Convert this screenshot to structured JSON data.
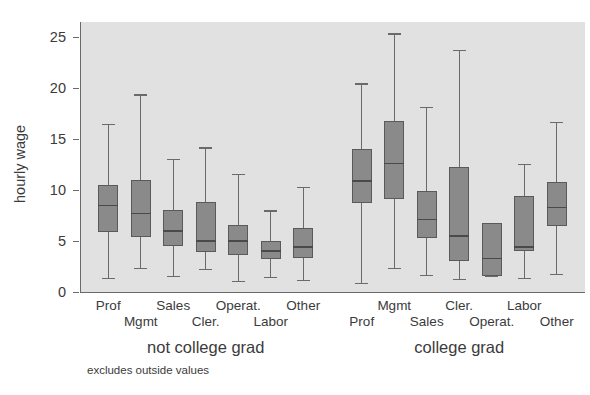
{
  "chart_data": {
    "type": "box",
    "title": "",
    "xlabel": "",
    "ylabel": "hourly wage",
    "ylim": [
      0,
      26.5
    ],
    "yticks": [
      0,
      5,
      10,
      15,
      20,
      25
    ],
    "ytick_labels": [
      "0",
      "5",
      "10",
      "15",
      "20",
      "25"
    ],
    "grid": false,
    "legend": "none",
    "note": "excludes outside values",
    "groups": [
      {
        "name": "not college grad",
        "categories": [
          "Prof",
          "Mgmt",
          "Sales",
          "Cler.",
          "Operat.",
          "Labor",
          "Other"
        ],
        "boxes": [
          {
            "label": "Prof",
            "whisker_low": 1.4,
            "q1": 5.9,
            "median": 8.5,
            "q3": 10.5,
            "whisker_high": 16.5
          },
          {
            "label": "Mgmt",
            "whisker_low": 2.4,
            "q1": 5.4,
            "median": 7.7,
            "q3": 11.0,
            "whisker_high": 19.4
          },
          {
            "label": "Sales",
            "whisker_low": 1.6,
            "q1": 4.5,
            "median": 6.0,
            "q3": 8.0,
            "whisker_high": 13.1
          },
          {
            "label": "Cler.",
            "whisker_low": 2.3,
            "q1": 3.9,
            "median": 5.0,
            "q3": 8.8,
            "whisker_high": 14.2
          },
          {
            "label": "Operat.",
            "whisker_low": 1.1,
            "q1": 3.6,
            "median": 5.0,
            "q3": 6.6,
            "whisker_high": 11.6
          },
          {
            "label": "Labor",
            "whisker_low": 1.5,
            "q1": 3.2,
            "median": 4.0,
            "q3": 5.0,
            "whisker_high": 8.0
          },
          {
            "label": "Other",
            "whisker_low": 1.2,
            "q1": 3.3,
            "median": 4.4,
            "q3": 6.3,
            "whisker_high": 10.3
          }
        ]
      },
      {
        "name": "college grad",
        "categories": [
          "Prof",
          "Mgmt",
          "Sales",
          "Cler.",
          "Operat.",
          "Labor",
          "Other"
        ],
        "boxes": [
          {
            "label": "Prof",
            "whisker_low": 0.9,
            "q1": 8.7,
            "median": 10.9,
            "q3": 14.0,
            "whisker_high": 20.5
          },
          {
            "label": "Mgmt",
            "whisker_low": 2.4,
            "q1": 9.1,
            "median": 12.6,
            "q3": 16.8,
            "whisker_high": 25.4
          },
          {
            "label": "Sales",
            "whisker_low": 1.7,
            "q1": 5.3,
            "median": 7.1,
            "q3": 9.9,
            "whisker_high": 18.2
          },
          {
            "label": "Cler.",
            "whisker_low": 1.3,
            "q1": 3.0,
            "median": 5.5,
            "q3": 12.3,
            "whisker_high": 23.8
          },
          {
            "label": "Operat.",
            "whisker_low": 1.6,
            "q1": 1.6,
            "median": 3.3,
            "q3": 6.8,
            "whisker_high": 6.8
          },
          {
            "label": "Labor",
            "whisker_low": 1.4,
            "q1": 4.0,
            "median": 4.4,
            "q3": 9.4,
            "whisker_high": 12.6
          },
          {
            "label": "Other",
            "whisker_low": 1.8,
            "q1": 6.5,
            "median": 8.3,
            "q3": 10.8,
            "whisker_high": 16.7
          }
        ]
      }
    ],
    "style": {
      "plot_background": "#e1e1e1",
      "box_fill": "#8a8a8a",
      "line_color": "#6a6a6a",
      "text_color": "#3b3b3b"
    }
  }
}
